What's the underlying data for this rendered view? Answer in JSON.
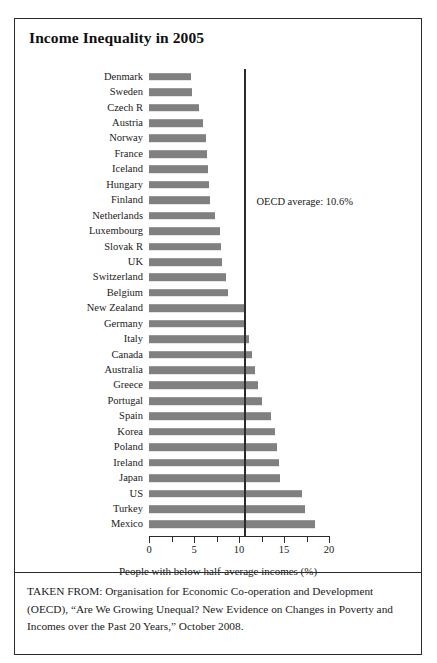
{
  "figure": {
    "title": "Income Inequality in 2005",
    "source_caption": "TAKEN FROM: Organisation for Economic Co-operation and Development (OECD), “Are We Growing Unequal? New Evidence on Changes in Poverty and Incomes over the Past 20 Years,” October 2008."
  },
  "chart_data": {
    "type": "bar",
    "orientation": "horizontal",
    "title": "Income Inequality in 2005",
    "xlabel": "People with below half-average incomes (%)",
    "ylabel": "",
    "xlim": [
      0,
      20
    ],
    "xticks": [
      0,
      5,
      10,
      15,
      20
    ],
    "xtick_labels": [
      "0",
      "5",
      "10",
      "15",
      "20"
    ],
    "minor_tick_step": 2.5,
    "grid": false,
    "legend": false,
    "bar_color": "#808080",
    "axis_color": "#2b2b2b",
    "categories": [
      "Denmark",
      "Sweden",
      "Czech R",
      "Austria",
      "Norway",
      "France",
      "Iceland",
      "Hungary",
      "Finland",
      "Netherlands",
      "Luxembourg",
      "Slovak R",
      "UK",
      "Switzerland",
      "Belgium",
      "New Zealand",
      "Germany",
      "Italy",
      "Canada",
      "Australia",
      "Greece",
      "Portugal",
      "Spain",
      "Korea",
      "Poland",
      "Ireland",
      "Japan",
      "US",
      "Turkey",
      "Mexico"
    ],
    "values": [
      4.7,
      4.8,
      5.6,
      6.0,
      6.3,
      6.4,
      6.5,
      6.7,
      6.8,
      7.3,
      7.9,
      8.0,
      8.1,
      8.6,
      8.8,
      10.6,
      10.8,
      11.1,
      11.4,
      11.8,
      12.1,
      12.5,
      13.6,
      14.0,
      14.2,
      14.4,
      14.6,
      17.0,
      17.3,
      18.4
    ],
    "annotations": [
      {
        "name": "oecd-average",
        "label": "OECD average: 10.6%",
        "value": 10.6,
        "type": "vertical-reference-line"
      }
    ]
  }
}
